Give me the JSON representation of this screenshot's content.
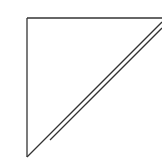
{
  "diagram": {
    "type": "right-triangle",
    "stroke_color": "#333333",
    "background": "#ffffff",
    "shape": {
      "top_left": [
        27,
        18
      ],
      "top_right": [
        162,
        18
      ],
      "bottom_left": [
        27,
        157
      ]
    },
    "hypotenuse_lines": [
      {
        "x1": 27,
        "y1": 157,
        "x2": 162,
        "y2": 22
      },
      {
        "x1": 50,
        "y1": 140,
        "x2": 162,
        "y2": 28
      }
    ]
  }
}
